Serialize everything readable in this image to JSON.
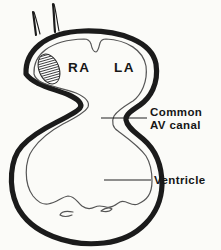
{
  "labels": {
    "right_atrium": "RA",
    "left_atrium": "LA",
    "av_canal_line1": "Common",
    "av_canal_line2": "AV canal",
    "ventricle": "Ventricle"
  },
  "colors": {
    "ink": "#1b1b1b",
    "inner_line": "#555555",
    "background": "#fbfbf8"
  }
}
